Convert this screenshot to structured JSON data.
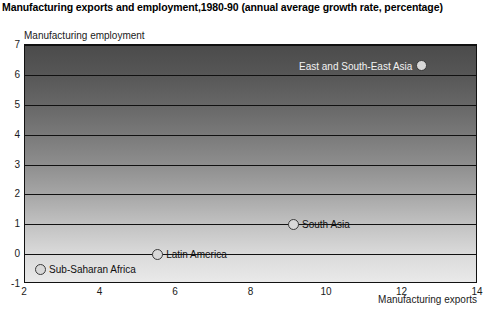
{
  "chart_title": "Manufacturing exports and employment,1980-90 (annual average growth rate, percentage)",
  "axes": {
    "ylabel": "Manufacturing employment",
    "xlabel": "Manufacturing exports",
    "yticks": [
      "7",
      "6",
      "5",
      "4",
      "3",
      "2",
      "1",
      "0",
      "-1"
    ],
    "xticks": [
      "2",
      "4",
      "6",
      "8",
      "10",
      "12",
      "14"
    ]
  },
  "points": [
    {
      "label": "East and South-East Asia"
    },
    {
      "label": "South Asia"
    },
    {
      "label": "Latin America"
    },
    {
      "label": "Sub-Saharan Africa"
    }
  ],
  "chart_data": {
    "type": "scatter",
    "title": "Manufacturing exports and employment,1980-90 (annual average growth rate, percentage)",
    "xlabel": "Manufacturing exports",
    "ylabel": "Manufacturing employment",
    "xlim": [
      2,
      14
    ],
    "ylim": [
      -1,
      7
    ],
    "xticks": [
      2,
      4,
      6,
      8,
      10,
      12,
      14
    ],
    "yticks": [
      -1,
      0,
      1,
      2,
      3,
      4,
      5,
      6,
      7
    ],
    "grid": "horizontal",
    "legend": "none",
    "series": [
      {
        "name": "regions",
        "marker": "circle",
        "marker_facecolor": "#d8d8d8",
        "marker_edgecolor": "#3a3a3a",
        "points": [
          {
            "label": "East and South-East Asia",
            "x": 12.5,
            "y": 6.3,
            "label_position": "left"
          },
          {
            "label": "South Asia",
            "x": 9.1,
            "y": 1.0,
            "label_position": "right"
          },
          {
            "label": "Latin America",
            "x": 5.5,
            "y": 0.0,
            "label_position": "right"
          },
          {
            "label": "Sub-Saharan Africa",
            "x": 2.4,
            "y": -0.5,
            "label_position": "right"
          }
        ]
      }
    ],
    "background": {
      "type": "vertical-gradient",
      "top_color": "#4b4b4b",
      "bottom_color": "#e9e9e9"
    }
  }
}
